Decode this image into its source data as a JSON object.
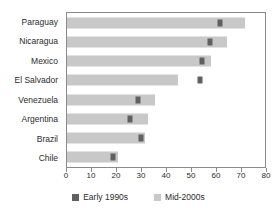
{
  "chart_data": {
    "type": "bar",
    "orientation": "horizontal",
    "title": "",
    "xlabel": "",
    "ylabel": "",
    "xlim": [
      0,
      80
    ],
    "xticks": [
      0,
      10,
      20,
      30,
      40,
      50,
      60,
      70,
      80
    ],
    "grid": false,
    "legend_position": "bottom",
    "categories": [
      "Paraguay",
      "Nicaragua",
      "Mexico",
      "El Salvador",
      "Venezuela",
      "Argentina",
      "Brazil",
      "Chile"
    ],
    "series": [
      {
        "name": "Early 1990s",
        "render": "marker",
        "color": "#606060",
        "values": [
          61,
          57,
          54,
          53,
          28.5,
          25,
          29.5,
          18.5
        ]
      },
      {
        "name": "Mid-2000s",
        "render": "bar",
        "color": "#c8c8c8",
        "values": [
          71,
          64,
          57.5,
          44.5,
          35,
          32.5,
          31,
          20.5
        ]
      }
    ]
  },
  "legend": {
    "entries": [
      {
        "label": "Early 1990s",
        "color": "#606060"
      },
      {
        "label": "Mid-2000s",
        "color": "#c8c8c8"
      }
    ]
  },
  "axis": {
    "tick_labels": [
      "0",
      "10",
      "20",
      "30",
      "40",
      "50",
      "60",
      "70",
      "80"
    ]
  },
  "colors": {
    "bar": "#c8c8c8",
    "marker": "#606060",
    "frame": "#8a8a8a",
    "text": "#2b2b2b",
    "background": "#ffffff"
  }
}
